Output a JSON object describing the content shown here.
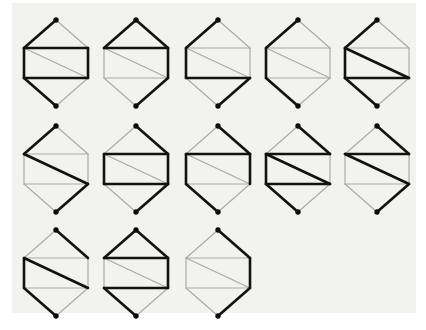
{
  "canvas": {
    "title": "Hexagonal graph figure grid",
    "background_color": "#ffffff",
    "plate_color": "#f2f2f0",
    "bold_edge_color": "#121212",
    "light_edge_color": "#a9a9a9",
    "vertex_color": "#0d0d0d",
    "rows": 3,
    "columns": 5,
    "figure_count": 13
  },
  "geometry": {
    "vertices": {
      "top": [
        40,
        8
      ],
      "upper_left": [
        8,
        36
      ],
      "upper_right": [
        72,
        36
      ],
      "lower_left": [
        8,
        66
      ],
      "lower_right": [
        72,
        66
      ],
      "bottom": [
        40,
        94
      ]
    },
    "edge_order": [
      "top-to-upper-left",
      "top-to-upper-right",
      "upper-left-to-upper-right",
      "upper-left-to-lower-left",
      "upper-right-to-lower-right",
      "upper-left-to-lower-right",
      "lower-left-to-lower-right",
      "lower-left-to-bottom",
      "lower-right-to-bottom"
    ]
  },
  "figures": [
    {
      "id": "figure-1",
      "label": "1",
      "row": 1,
      "col": 1,
      "x": 16,
      "y": 12,
      "edges": {
        "top-to-upper-left": "bold",
        "top-to-upper-right": "light",
        "upper-left-to-upper-right": "bold",
        "upper-left-to-lower-left": "bold",
        "upper-right-to-lower-right": "bold",
        "upper-left-to-lower-right": "light",
        "lower-left-to-lower-right": "bold",
        "lower-left-to-bottom": "bold",
        "lower-right-to-bottom": "light"
      }
    },
    {
      "id": "figure-2",
      "label": "2",
      "row": 1,
      "col": 2,
      "x": 96,
      "y": 12,
      "edges": {
        "top-to-upper-left": "bold",
        "top-to-upper-right": "bold",
        "upper-left-to-upper-right": "bold",
        "upper-left-to-lower-left": "light",
        "upper-right-to-lower-right": "bold",
        "upper-left-to-lower-right": "light",
        "lower-left-to-lower-right": "light",
        "lower-left-to-bottom": "light",
        "lower-right-to-bottom": "bold"
      }
    },
    {
      "id": "figure-3",
      "label": "3",
      "row": 1,
      "col": 3,
      "x": 178,
      "y": 12,
      "edges": {
        "top-to-upper-left": "bold",
        "top-to-upper-right": "light",
        "upper-left-to-upper-right": "light",
        "upper-left-to-lower-left": "bold",
        "upper-right-to-lower-right": "light",
        "upper-left-to-lower-right": "light",
        "lower-left-to-lower-right": "bold",
        "lower-left-to-bottom": "light",
        "lower-right-to-bottom": "bold"
      }
    },
    {
      "id": "figure-4",
      "label": "4",
      "row": 1,
      "col": 4,
      "x": 258,
      "y": 12,
      "edges": {
        "top-to-upper-left": "bold",
        "top-to-upper-right": "light",
        "upper-left-to-upper-right": "light",
        "upper-left-to-lower-left": "bold",
        "upper-right-to-lower-right": "light",
        "upper-left-to-lower-right": "light",
        "lower-left-to-lower-right": "light",
        "lower-left-to-bottom": "bold",
        "lower-right-to-bottom": "light"
      }
    },
    {
      "id": "figure-5",
      "label": "5",
      "row": 1,
      "col": 5,
      "x": 337,
      "y": 12,
      "edges": {
        "top-to-upper-left": "bold",
        "top-to-upper-right": "light",
        "upper-left-to-upper-right": "light",
        "upper-left-to-lower-left": "bold",
        "upper-right-to-lower-right": "light",
        "upper-left-to-lower-right": "bold",
        "lower-left-to-lower-right": "bold",
        "lower-left-to-bottom": "bold",
        "lower-right-to-bottom": "light"
      }
    },
    {
      "id": "figure-6",
      "label": "6",
      "row": 2,
      "col": 1,
      "x": 16,
      "y": 118,
      "edges": {
        "top-to-upper-left": "bold",
        "top-to-upper-right": "light",
        "upper-left-to-upper-right": "light",
        "upper-left-to-lower-left": "light",
        "upper-right-to-lower-right": "light",
        "upper-left-to-lower-right": "bold",
        "lower-left-to-lower-right": "light",
        "lower-left-to-bottom": "light",
        "lower-right-to-bottom": "bold"
      }
    },
    {
      "id": "figure-7",
      "label": "7",
      "row": 2,
      "col": 2,
      "x": 96,
      "y": 118,
      "edges": {
        "top-to-upper-left": "light",
        "top-to-upper-right": "bold",
        "upper-left-to-upper-right": "bold",
        "upper-left-to-lower-left": "bold",
        "upper-right-to-lower-right": "bold",
        "upper-left-to-lower-right": "light",
        "lower-left-to-lower-right": "bold",
        "lower-left-to-bottom": "light",
        "lower-right-to-bottom": "bold"
      }
    },
    {
      "id": "figure-8",
      "label": "8",
      "row": 2,
      "col": 3,
      "x": 178,
      "y": 118,
      "edges": {
        "top-to-upper-left": "light",
        "top-to-upper-right": "bold",
        "upper-left-to-upper-right": "bold",
        "upper-left-to-lower-left": "bold",
        "upper-right-to-lower-right": "bold",
        "upper-left-to-lower-right": "light",
        "lower-left-to-lower-right": "light",
        "lower-left-to-bottom": "bold",
        "lower-right-to-bottom": "light"
      }
    },
    {
      "id": "figure-9",
      "label": "9",
      "row": 2,
      "col": 4,
      "x": 258,
      "y": 118,
      "edges": {
        "top-to-upper-left": "light",
        "top-to-upper-right": "bold",
        "upper-left-to-upper-right": "bold",
        "upper-left-to-lower-left": "bold",
        "upper-right-to-lower-right": "light",
        "upper-left-to-lower-right": "bold",
        "lower-left-to-lower-right": "bold",
        "lower-left-to-bottom": "bold",
        "lower-right-to-bottom": "light"
      }
    },
    {
      "id": "figure-10",
      "label": "10",
      "row": 2,
      "col": 5,
      "x": 337,
      "y": 118,
      "edges": {
        "top-to-upper-left": "light",
        "top-to-upper-right": "bold",
        "upper-left-to-upper-right": "bold",
        "upper-left-to-lower-left": "light",
        "upper-right-to-lower-right": "light",
        "upper-left-to-lower-right": "bold",
        "lower-left-to-lower-right": "light",
        "lower-left-to-bottom": "light",
        "lower-right-to-bottom": "bold"
      }
    },
    {
      "id": "figure-11",
      "label": "11",
      "row": 3,
      "col": 1,
      "x": 16,
      "y": 222,
      "edges": {
        "top-to-upper-left": "light",
        "top-to-upper-right": "bold",
        "upper-left-to-upper-right": "light",
        "upper-left-to-lower-left": "bold",
        "upper-right-to-lower-right": "light",
        "upper-left-to-lower-right": "bold",
        "lower-left-to-lower-right": "light",
        "lower-left-to-bottom": "bold",
        "lower-right-to-bottom": "light"
      }
    },
    {
      "id": "figure-12",
      "label": "12",
      "row": 3,
      "col": 2,
      "x": 96,
      "y": 222,
      "edges": {
        "top-to-upper-left": "bold",
        "top-to-upper-right": "bold",
        "upper-left-to-upper-right": "bold",
        "upper-left-to-lower-left": "light",
        "upper-right-to-lower-right": "bold",
        "upper-left-to-lower-right": "light",
        "lower-left-to-lower-right": "bold",
        "lower-left-to-bottom": "bold",
        "lower-right-to-bottom": "light"
      }
    },
    {
      "id": "figure-13",
      "label": "13",
      "row": 3,
      "col": 3,
      "x": 178,
      "y": 222,
      "edges": {
        "top-to-upper-left": "light",
        "top-to-upper-right": "bold",
        "upper-left-to-upper-right": "light",
        "upper-left-to-lower-left": "light",
        "upper-right-to-lower-right": "bold",
        "upper-left-to-lower-right": "light",
        "lower-left-to-lower-right": "light",
        "lower-left-to-bottom": "light",
        "lower-right-to-bottom": "bold"
      }
    }
  ]
}
